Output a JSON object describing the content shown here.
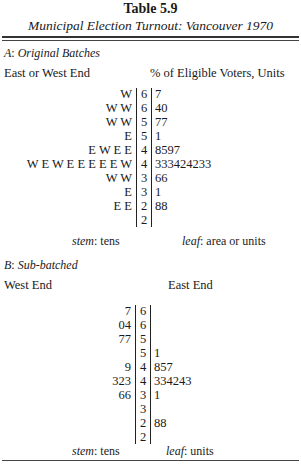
{
  "title": "Table 5.9",
  "subtitle": "Municipal Election Turnout: Vancouver 1970",
  "section_a": {
    "label_letter": "A",
    "label_text": "Original Batches",
    "left_header": "East or West End",
    "right_header": "% of Eligible Voters, Units",
    "rows": [
      {
        "left": "W",
        "stem": "6",
        "leaf": "7"
      },
      {
        "left": "W W",
        "stem": "6",
        "leaf": "40"
      },
      {
        "left": "W W",
        "stem": "5",
        "leaf": "77"
      },
      {
        "left": "E",
        "stem": "5",
        "leaf": "1"
      },
      {
        "left": "E W E E",
        "stem": "4",
        "leaf": "8597"
      },
      {
        "left": "W E W E E E E E W",
        "stem": "4",
        "leaf": "333424233"
      },
      {
        "left": "W W",
        "stem": "3",
        "leaf": "66"
      },
      {
        "left": "E",
        "stem": "3",
        "leaf": "1"
      },
      {
        "left": "E E",
        "stem": "2",
        "leaf": "88"
      },
      {
        "left": "",
        "stem": "2",
        "leaf": ""
      }
    ],
    "stem_label": "stem",
    "stem_value": ": tens",
    "leaf_label": "leaf",
    "leaf_value": ": area or units"
  },
  "section_b": {
    "label_letter": "B",
    "label_text": "Sub-batched",
    "left_header": "West End",
    "right_header": "East End",
    "rows": [
      {
        "left": "7",
        "stem": "6",
        "leaf": ""
      },
      {
        "left": "04",
        "stem": "6",
        "leaf": ""
      },
      {
        "left": "77",
        "stem": "5",
        "leaf": ""
      },
      {
        "left": "",
        "stem": "5",
        "leaf": "1"
      },
      {
        "left": "9",
        "stem": "4",
        "leaf": "857"
      },
      {
        "left": "323",
        "stem": "4",
        "leaf": "334243"
      },
      {
        "left": "66",
        "stem": "3",
        "leaf": "1"
      },
      {
        "left": "",
        "stem": "3",
        "leaf": ""
      },
      {
        "left": "",
        "stem": "2",
        "leaf": "88"
      },
      {
        "left": "",
        "stem": "2",
        "leaf": ""
      }
    ],
    "stem_label": "stem",
    "stem_value": ": tens",
    "leaf_label": "leaf",
    "leaf_value": ": units"
  }
}
